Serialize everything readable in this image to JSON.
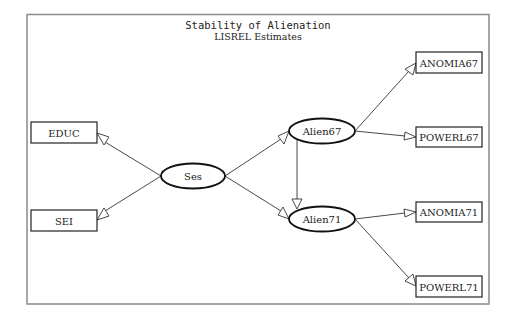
{
  "title": "Stability of Alienation",
  "subtitle": "LISREL Estimates",
  "nodes": {
    "educ": {
      "label": "EDUC",
      "shape": "rect"
    },
    "sei": {
      "label": "SEI",
      "shape": "rect"
    },
    "ses": {
      "label": "Ses",
      "shape": "ellipse"
    },
    "alien67": {
      "label": "Alien67",
      "shape": "ellipse"
    },
    "alien71": {
      "label": "Alien71",
      "shape": "ellipse"
    },
    "anomia67": {
      "label": "ANOMIA67",
      "shape": "rect"
    },
    "powerl67": {
      "label": "POWERL67",
      "shape": "rect"
    },
    "anomia71": {
      "label": "ANOMIA71",
      "shape": "rect"
    },
    "powerl71": {
      "label": "POWERL71",
      "shape": "rect"
    }
  },
  "edges": [
    {
      "from": "Ses",
      "to": "EDUC"
    },
    {
      "from": "Ses",
      "to": "SEI"
    },
    {
      "from": "Ses",
      "to": "Alien67"
    },
    {
      "from": "Ses",
      "to": "Alien71"
    },
    {
      "from": "Alien67",
      "to": "Alien71"
    },
    {
      "from": "Alien67",
      "to": "ANOMIA67"
    },
    {
      "from": "Alien67",
      "to": "POWERL67"
    },
    {
      "from": "Alien71",
      "to": "ANOMIA71"
    },
    {
      "from": "Alien71",
      "to": "POWERL71"
    }
  ]
}
